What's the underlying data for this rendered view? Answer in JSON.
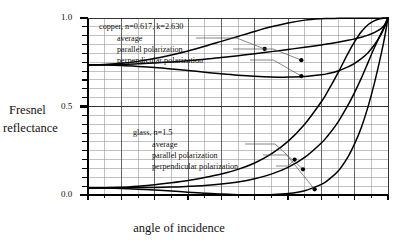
{
  "chart_data": {
    "type": "line",
    "title": "",
    "xlabel": "angle of incidence",
    "ylabel": "Fresnel reflectance",
    "ylabel_lines": [
      "Fresnel",
      "reflectance"
    ],
    "xlim": [
      0,
      90
    ],
    "ylim": [
      0.0,
      1.0
    ],
    "xticks": [
      0,
      10,
      20,
      30,
      40,
      50,
      60,
      70,
      80,
      90
    ],
    "xtick_labels": [
      "0",
      "10",
      "20",
      "30",
      "40",
      "50",
      "60",
      "70",
      "80",
      "90"
    ],
    "yticks": [
      0.0,
      0.5,
      1.0
    ],
    "ytick_labels": [
      "0.0",
      "0.5",
      "1.0"
    ],
    "x_minor_step": 5,
    "y_minor_step": 0.05,
    "grid": true,
    "grid_color": "#9a9a9a",
    "grid_major_color": "#555555",
    "curve_color": "#000000",
    "legend_position": "inside-annotations",
    "annotations": [
      {
        "name": "copper-group",
        "header": "copper, n=0.617, k=2.630",
        "items": [
          {
            "label": "average",
            "point_x": 53.0,
            "point_y": 0.825
          },
          {
            "label": "parallel polarization",
            "point_x": 64.0,
            "point_y": 0.762
          },
          {
            "label": "perpendicular polarization",
            "point_x": 64.0,
            "point_y": 0.672
          }
        ]
      },
      {
        "name": "glass-group",
        "header": "glass, n=1.5",
        "items": [
          {
            "label": "average",
            "point_x": 64.5,
            "point_y": 0.145
          },
          {
            "label": "parallel polarization",
            "point_x": 68.0,
            "point_y": 0.032
          },
          {
            "label": "perpendicular polarization",
            "point_x": 62.0,
            "point_y": 0.2
          }
        ]
      }
    ],
    "x": [
      0,
      5,
      10,
      15,
      20,
      25,
      30,
      35,
      40,
      45,
      50,
      55,
      60,
      65,
      70,
      72,
      75,
      78,
      80,
      82,
      84,
      86,
      88,
      89,
      90
    ],
    "series": [
      {
        "name": "copper perpendicular polarization",
        "material": "copper",
        "polarization": "perpendicular",
        "values": [
          0.735,
          0.734,
          0.731,
          0.726,
          0.72,
          0.712,
          0.703,
          0.694,
          0.685,
          0.677,
          0.671,
          0.667,
          0.666,
          0.669,
          0.679,
          0.686,
          0.701,
          0.724,
          0.744,
          0.77,
          0.804,
          0.85,
          0.91,
          0.952,
          1.0
        ]
      },
      {
        "name": "copper average",
        "material": "copper",
        "polarization": "average",
        "values": [
          0.735,
          0.736,
          0.738,
          0.741,
          0.746,
          0.752,
          0.759,
          0.767,
          0.777,
          0.787,
          0.798,
          0.81,
          0.822,
          0.835,
          0.848,
          0.854,
          0.863,
          0.874,
          0.882,
          0.891,
          0.903,
          0.919,
          0.941,
          0.963,
          1.0
        ]
      },
      {
        "name": "copper parallel polarization",
        "material": "copper",
        "polarization": "parallel",
        "values": [
          0.735,
          0.737,
          0.744,
          0.755,
          0.771,
          0.791,
          0.814,
          0.84,
          0.868,
          0.896,
          0.924,
          0.95,
          0.972,
          0.988,
          0.996,
          0.997,
          0.998,
          0.998,
          0.998,
          0.998,
          0.998,
          0.999,
          0.999,
          1.0,
          1.0
        ]
      },
      {
        "name": "glass parallel polarization",
        "material": "glass",
        "polarization": "parallel",
        "values": [
          0.04,
          0.039,
          0.037,
          0.033,
          0.028,
          0.022,
          0.016,
          0.01,
          0.005,
          0.002,
          0.0,
          0.002,
          0.008,
          0.024,
          0.06,
          0.084,
          0.134,
          0.216,
          0.29,
          0.382,
          0.498,
          0.638,
          0.8,
          0.892,
          1.0
        ]
      },
      {
        "name": "glass average",
        "material": "glass",
        "polarization": "average",
        "values": [
          0.04,
          0.04,
          0.041,
          0.042,
          0.043,
          0.045,
          0.049,
          0.054,
          0.062,
          0.074,
          0.092,
          0.118,
          0.156,
          0.212,
          0.294,
          0.336,
          0.412,
          0.508,
          0.58,
          0.66,
          0.748,
          0.836,
          0.916,
          0.955,
          1.0
        ]
      },
      {
        "name": "glass perpendicular polarization",
        "material": "glass",
        "polarization": "perpendicular",
        "values": [
          0.04,
          0.041,
          0.044,
          0.05,
          0.058,
          0.069,
          0.082,
          0.099,
          0.119,
          0.145,
          0.181,
          0.232,
          0.303,
          0.4,
          0.527,
          0.588,
          0.69,
          0.8,
          0.866,
          0.922,
          0.962,
          0.985,
          0.997,
          0.999,
          1.0
        ]
      }
    ]
  }
}
